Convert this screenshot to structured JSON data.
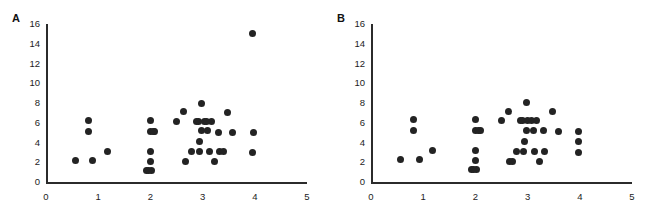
{
  "figure": {
    "background_color": "#ffffff",
    "marker_color": "#232323",
    "axis_color": "#2b2b2b",
    "width": 655,
    "height": 212
  },
  "panels": [
    {
      "label": "A",
      "label_x": 12,
      "label_y": 12,
      "origin_x": 46,
      "origin_y": 182,
      "plot_width": 261,
      "plot_height": 158
    },
    {
      "label": "B",
      "label_x": 337,
      "label_y": 12,
      "origin_x": 371,
      "origin_y": 182,
      "plot_width": 261,
      "plot_height": 158
    }
  ],
  "chart_data": [
    {
      "type": "scatter",
      "panel": "A",
      "title": "",
      "xlabel": "",
      "ylabel": "",
      "xlim": [
        0,
        5
      ],
      "ylim": [
        0,
        16
      ],
      "xticks": [
        0,
        1,
        2,
        3,
        4,
        5
      ],
      "yticks": [
        0,
        2,
        4,
        6,
        8,
        10,
        12,
        14,
        16
      ],
      "xtick_labels": [
        "0",
        "1",
        "2",
        "3",
        "4",
        "5"
      ],
      "ytick_labels": [
        "0",
        "2",
        "4",
        "6",
        "8",
        "10",
        "12",
        "14",
        "16"
      ],
      "grid": false,
      "legend": null,
      "n_points": 38,
      "points": [
        [
          0.57,
          2.2
        ],
        [
          0.82,
          6.2
        ],
        [
          0.82,
          5.1
        ],
        [
          0.9,
          2.2
        ],
        [
          1.18,
          3.1
        ],
        [
          1.93,
          1.2
        ],
        [
          2.02,
          1.2
        ],
        [
          2.0,
          2.1
        ],
        [
          2.0,
          3.1
        ],
        [
          2.0,
          5.1
        ],
        [
          2.08,
          5.1
        ],
        [
          2.0,
          6.2
        ],
        [
          2.5,
          6.1
        ],
        [
          2.63,
          7.1
        ],
        [
          2.67,
          2.1
        ],
        [
          2.78,
          3.1
        ],
        [
          2.95,
          4.1
        ],
        [
          2.97,
          8.0
        ],
        [
          2.93,
          6.1
        ],
        [
          3.03,
          6.1
        ],
        [
          2.98,
          5.2
        ],
        [
          3.1,
          5.2
        ],
        [
          3.18,
          6.1
        ],
        [
          3.14,
          3.1
        ],
        [
          3.22,
          2.1
        ],
        [
          3.3,
          5.0
        ],
        [
          3.32,
          3.1
        ],
        [
          3.48,
          7.0
        ],
        [
          3.57,
          5.0
        ],
        [
          3.95,
          15.0
        ],
        [
          3.97,
          5.0
        ],
        [
          3.95,
          3.0
        ],
        [
          2.88,
          6.1
        ],
        [
          3.07,
          6.1
        ],
        [
          2.05,
          5.1
        ],
        [
          1.97,
          1.2
        ],
        [
          2.95,
          3.1
        ],
        [
          3.4,
          3.1
        ]
      ]
    },
    {
      "type": "scatter",
      "panel": "B",
      "title": "",
      "xlabel": "",
      "ylabel": "",
      "xlim": [
        0,
        5
      ],
      "ylim": [
        0,
        16
      ],
      "xticks": [
        0,
        1,
        2,
        3,
        4,
        5
      ],
      "yticks": [
        0,
        2,
        4,
        6,
        8,
        10,
        12,
        14,
        16
      ],
      "xtick_labels": [
        "0",
        "1",
        "2",
        "3",
        "4",
        "5"
      ],
      "ytick_labels": [
        "0",
        "2",
        "4",
        "6",
        "8",
        "10",
        "12",
        "14",
        "16"
      ],
      "grid": false,
      "legend": null,
      "n_points": 38,
      "points": [
        [
          0.57,
          2.3
        ],
        [
          0.82,
          6.3
        ],
        [
          0.82,
          5.2
        ],
        [
          0.92,
          2.3
        ],
        [
          1.18,
          3.2
        ],
        [
          1.93,
          1.3
        ],
        [
          2.02,
          1.3
        ],
        [
          1.97,
          1.3
        ],
        [
          2.0,
          2.2
        ],
        [
          2.0,
          3.2
        ],
        [
          2.0,
          5.2
        ],
        [
          2.1,
          5.2
        ],
        [
          2.0,
          6.3
        ],
        [
          2.5,
          6.2
        ],
        [
          2.63,
          7.1
        ],
        [
          2.65,
          2.1
        ],
        [
          2.78,
          3.1
        ],
        [
          2.95,
          4.1
        ],
        [
          2.98,
          8.1
        ],
        [
          2.9,
          6.2
        ],
        [
          3.0,
          6.2
        ],
        [
          3.08,
          6.2
        ],
        [
          2.98,
          5.2
        ],
        [
          3.18,
          6.2
        ],
        [
          3.14,
          3.1
        ],
        [
          3.22,
          2.1
        ],
        [
          3.3,
          5.2
        ],
        [
          3.33,
          3.1
        ],
        [
          3.48,
          7.1
        ],
        [
          3.6,
          5.1
        ],
        [
          3.97,
          5.1
        ],
        [
          3.97,
          4.1
        ],
        [
          3.97,
          3.0
        ],
        [
          2.86,
          6.2
        ],
        [
          2.05,
          5.2
        ],
        [
          2.93,
          3.1
        ],
        [
          3.12,
          5.2
        ],
        [
          2.72,
          2.1
        ]
      ]
    }
  ]
}
